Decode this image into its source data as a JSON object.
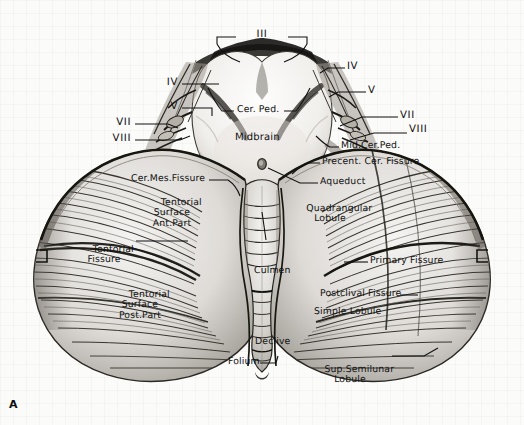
{
  "figure": {
    "letter": "A",
    "background_color": "#fbfbfa",
    "ink_color": "#111111"
  },
  "labels": [
    {
      "id": "iii",
      "text": "III",
      "x": 262,
      "y": 36,
      "align": "ctr",
      "style": "roman"
    },
    {
      "id": "iv-left",
      "text": "IV",
      "x": 178,
      "y": 84,
      "align": "rt",
      "style": "roman"
    },
    {
      "id": "v-left",
      "text": "V",
      "x": 178,
      "y": 108,
      "align": "rt",
      "style": "roman"
    },
    {
      "id": "vii-left",
      "text": "VII",
      "x": 131,
      "y": 126,
      "align": "rt",
      "style": "roman"
    },
    {
      "id": "viii-left",
      "text": "VIII",
      "x": 131,
      "y": 141,
      "align": "rt",
      "style": "roman"
    },
    {
      "id": "iv-right",
      "text": "IV",
      "x": 347,
      "y": 68,
      "align": "lt",
      "style": "roman"
    },
    {
      "id": "v-right",
      "text": "V",
      "x": 368,
      "y": 92,
      "align": "lt",
      "style": "roman"
    },
    {
      "id": "vii-right",
      "text": "VII",
      "x": 400,
      "y": 117,
      "align": "lt",
      "style": "roman"
    },
    {
      "id": "viii-right",
      "text": "VIII",
      "x": 409,
      "y": 131,
      "align": "lt",
      "style": "roman"
    },
    {
      "id": "cer-ped",
      "text": "Cer. Ped.",
      "x": 237,
      "y": 111,
      "align": "lt",
      "style": "plain"
    },
    {
      "id": "midbrain",
      "text": "Midbrain",
      "x": 235,
      "y": 139,
      "align": "lt",
      "style": "plain"
    },
    {
      "id": "mid-cer-ped",
      "text": "Mid.Cer.Ped.",
      "x": 341,
      "y": 147,
      "align": "lt",
      "style": "plain"
    },
    {
      "id": "precent-cer-fissure",
      "text": "Precent. Cer. Fissure",
      "x": 322,
      "y": 163,
      "align": "lt",
      "style": "plain"
    },
    {
      "id": "aqueduct",
      "text": "Aqueduct",
      "x": 320,
      "y": 183,
      "align": "lt",
      "style": "plain"
    },
    {
      "id": "cer-mes-fissure",
      "text": "Cer.Mes.Fissure",
      "x": 131,
      "y": 180,
      "align": "lt",
      "style": "plain"
    },
    {
      "id": "tentorial-surface-ant",
      "text": "Tentorial\nSurface\nAnt.Part",
      "x": 172,
      "y": 193,
      "align": "ctr",
      "style": "plain"
    },
    {
      "id": "quadrangular-lobule",
      "text": "Quadrangular\nLobule",
      "x": 330,
      "y": 199,
      "align": "ctr",
      "style": "plain"
    },
    {
      "id": "tentorial-fissure",
      "text": "Tentorial\nFissure",
      "x": 104,
      "y": 240,
      "align": "ctr",
      "style": "plain"
    },
    {
      "id": "primary-fissure",
      "text": "Primary Fissure",
      "x": 370,
      "y": 262,
      "align": "lt",
      "style": "plain"
    },
    {
      "id": "culmen",
      "text": "Culmen",
      "x": 254,
      "y": 272,
      "align": "lt",
      "style": "plain"
    },
    {
      "id": "tentorial-surface-post",
      "text": "Tentorial\nSurface\nPost.Part",
      "x": 140,
      "y": 285,
      "align": "ctr",
      "style": "plain"
    },
    {
      "id": "postclival-fissure",
      "text": "Postclival Fissure",
      "x": 320,
      "y": 295,
      "align": "lt",
      "style": "plain"
    },
    {
      "id": "simple-lobule",
      "text": "Simple Lobule",
      "x": 314,
      "y": 313,
      "align": "lt",
      "style": "plain"
    },
    {
      "id": "declive",
      "text": "Declive",
      "x": 255,
      "y": 343,
      "align": "lt",
      "style": "plain"
    },
    {
      "id": "folium",
      "text": "Folium",
      "x": 228,
      "y": 363,
      "align": "lt",
      "style": "plain"
    },
    {
      "id": "sup-semilunar-lobule",
      "text": "Sup.Semilunar\nLobule",
      "x": 350,
      "y": 360,
      "align": "ctr",
      "style": "plain"
    }
  ],
  "structures": {
    "cerebellum": "superior cerebellar hemispheres and vermis",
    "midbrain": "midbrain with cerebral peduncles and aqueduct",
    "aqueduct_marker": "small oval opening at midline of midbrain tegmentum",
    "cranial_nerves": [
      "III",
      "IV",
      "V",
      "VII",
      "VIII"
    ]
  }
}
